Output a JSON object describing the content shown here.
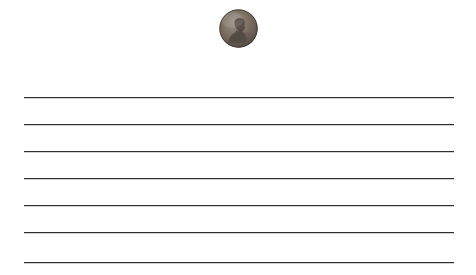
{
  "scene": {
    "width": 476,
    "height": 275,
    "background_color": "#ffffff",
    "description": "A single US Lincoln penny resting on a sheet of white ruled notebook paper"
  },
  "paper": {
    "name": "ruled-paper",
    "background_color": "#ffffff",
    "line_color": "#2e2e2e",
    "line_thickness_px": 1,
    "line_left_x": 24,
    "line_right_x": 454,
    "line_count": 7,
    "line_spacing_px": 27,
    "lines": [
      {
        "index": 1,
        "y": 97
      },
      {
        "index": 2,
        "y": 124
      },
      {
        "index": 3,
        "y": 151
      },
      {
        "index": 4,
        "y": 178
      },
      {
        "index": 5,
        "y": 205
      },
      {
        "index": 6,
        "y": 232
      },
      {
        "index": 7,
        "y": 262
      }
    ]
  },
  "coin": {
    "name": "penny-coin",
    "label": "US Lincoln penny (obverse)",
    "center_x": 239,
    "center_y": 28,
    "diameter_px": 39,
    "left_x": 219,
    "top_y": 9,
    "rim_color": "#6e6054",
    "face_color": "#7d7067",
    "shadow_color": "#4a423b",
    "highlight_color": "#9a8d81",
    "portrait_facing": "right",
    "portrait_color": "#5a5048"
  }
}
